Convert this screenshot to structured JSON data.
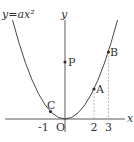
{
  "diagram": {
    "equation_label": "y=ax²",
    "axes": {
      "x_label": "x",
      "y_label": "y",
      "origin_label": "O"
    },
    "ticks": [
      "-1",
      "2",
      "3"
    ],
    "points": [
      {
        "name": "C",
        "x": -1,
        "description": "on parabola"
      },
      {
        "name": "A",
        "x": 2,
        "description": "on parabola"
      },
      {
        "name": "B",
        "x": 3,
        "description": "on parabola"
      },
      {
        "name": "P",
        "x": 0,
        "description": "on y-axis"
      }
    ],
    "colors": {
      "line": "#333333",
      "dashed": "#999999"
    }
  }
}
